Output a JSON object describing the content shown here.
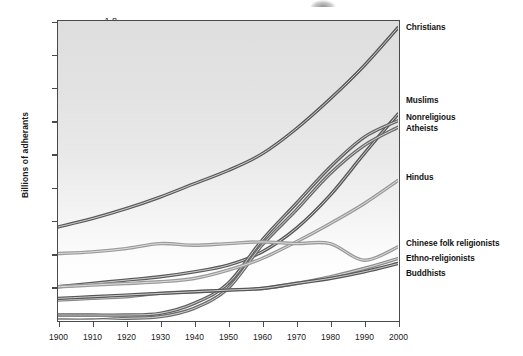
{
  "chart_data": {
    "type": "line",
    "title": "",
    "xlabel": "",
    "ylabel": "Billions of adherants",
    "xlim": [
      1900,
      2000
    ],
    "ylim": [
      0,
      1.8
    ],
    "grid": false,
    "legend_position": "right-of-plot-inline-labels",
    "x": [
      1900,
      1910,
      1920,
      1930,
      1940,
      1950,
      1960,
      1970,
      1980,
      1990,
      2000
    ],
    "xticklabels": [
      "1900",
      "1910",
      "1920",
      "1930",
      "1940",
      "1950",
      "1960",
      "1970",
      "1980",
      "1990",
      "2000"
    ],
    "yticks": [
      0.2,
      0.4,
      0.6,
      0.8,
      1.0,
      1.2,
      1.4,
      1.6,
      1.8
    ],
    "yticklabels": [
      "0.2",
      "0.4",
      "0.6",
      "0.8",
      "1.0",
      "1.2",
      "1.4",
      "1.6",
      "1.8"
    ],
    "series": [
      {
        "name": "Christians",
        "color": "#5a5a5a",
        "values": [
          0.56,
          0.61,
          0.67,
          0.74,
          0.82,
          0.9,
          1.0,
          1.15,
          1.33,
          1.53,
          1.76
        ]
      },
      {
        "name": "Muslims",
        "color": "#5a5a5a",
        "values": [
          0.2,
          0.22,
          0.24,
          0.26,
          0.29,
          0.33,
          0.41,
          0.55,
          0.75,
          1.0,
          1.24
        ]
      },
      {
        "name": "Nonreligious",
        "color": "#616161",
        "values": [
          0.03,
          0.03,
          0.03,
          0.04,
          0.1,
          0.22,
          0.48,
          0.7,
          0.92,
          1.1,
          1.2
        ]
      },
      {
        "name": "Atheists",
        "color": "#6b6b6b",
        "values": [
          0.0,
          0.0,
          0.01,
          0.02,
          0.07,
          0.19,
          0.45,
          0.66,
          0.88,
          1.05,
          1.16
        ]
      },
      {
        "name": "Hindus",
        "color": "#9a9a9a",
        "values": [
          0.2,
          0.21,
          0.22,
          0.23,
          0.25,
          0.3,
          0.37,
          0.47,
          0.58,
          0.7,
          0.84
        ]
      },
      {
        "name": "Chinese folk religionists",
        "color": "#9a9a9a",
        "values": [
          0.4,
          0.41,
          0.43,
          0.46,
          0.45,
          0.46,
          0.47,
          0.46,
          0.46,
          0.36,
          0.44
        ]
      },
      {
        "name": "Ethno-religionists",
        "color": "#8c8c8c",
        "values": [
          0.12,
          0.13,
          0.14,
          0.16,
          0.17,
          0.18,
          0.19,
          0.22,
          0.26,
          0.31,
          0.37
        ]
      },
      {
        "name": "Buddhists",
        "color": "#555555",
        "values": [
          0.13,
          0.14,
          0.15,
          0.16,
          0.17,
          0.18,
          0.19,
          0.22,
          0.25,
          0.29,
          0.34
        ]
      }
    ],
    "series_labels": [
      {
        "text": "Christians",
        "y_value": 1.76
      },
      {
        "text": "Muslims",
        "y_value": 1.32
      },
      {
        "text": "Nonreligious",
        "y_value": 1.22
      },
      {
        "text": "Atheists",
        "y_value": 1.15
      },
      {
        "text": "Hindus",
        "y_value": 0.86
      },
      {
        "text": "Chinese folk religionists",
        "y_value": 0.46
      },
      {
        "text": "Ethno-religionists",
        "y_value": 0.37
      },
      {
        "text": "Buddhists",
        "y_value": 0.28
      }
    ]
  }
}
